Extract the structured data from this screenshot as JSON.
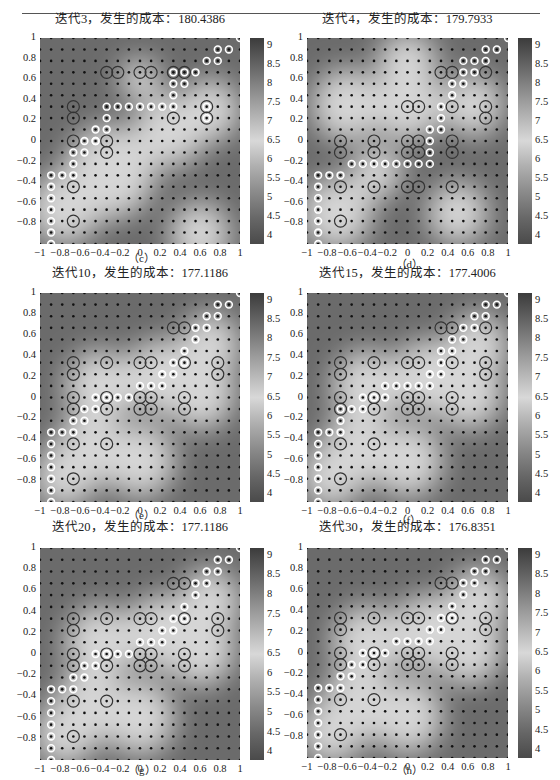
{
  "figure": {
    "panels": [
      {
        "id": "c",
        "title": "迭代3，发生的成本：180.4386",
        "caption": "（c）"
      },
      {
        "id": "d",
        "title": "迭代4，发生的成本：179.7933",
        "caption": "（d）"
      },
      {
        "id": "e",
        "title": "迭代10，发生的成本：177.1186",
        "caption": "（e）"
      },
      {
        "id": "f",
        "title": "迭代15，发生的成本：177.4006",
        "caption": "（f）"
      },
      {
        "id": "g",
        "title": "迭代20，发生的成本：177.1186",
        "caption": "（g）"
      },
      {
        "id": "h",
        "title": "迭代30，发生的成本：176.8351",
        "caption": "（h）"
      }
    ],
    "y_ticks": [
      "1",
      "0.8",
      "0.6",
      "0.4",
      "0.2",
      "0",
      "−0.2",
      "−0.4",
      "−0.6",
      "−0.8"
    ],
    "x_ticks": [
      "−1",
      "−0.8",
      "−0.6",
      "−0.4",
      "−0.2",
      "0",
      "0.2",
      "0.4",
      "0.6",
      "0.8",
      "1"
    ],
    "colorbar_ticks": [
      "9",
      "8.5",
      "8",
      "7.5",
      "7",
      "6.5",
      "6",
      "5.5",
      "5",
      "4.5",
      "4"
    ]
  },
  "chart_data": [
    {
      "type": "heatmap",
      "title": "迭代3，发生的成本：180.4386",
      "iteration": 3,
      "cost": 180.4386,
      "xlim": [
        -1,
        1
      ],
      "ylim": [
        -1,
        1
      ],
      "colorbar_range": [
        3.8,
        9.2
      ],
      "grid_points": "19x19",
      "caption": "(c)"
    },
    {
      "type": "heatmap",
      "title": "迭代4，发生的成本：179.7933",
      "iteration": 4,
      "cost": 179.7933,
      "xlim": [
        -1,
        1
      ],
      "ylim": [
        -1,
        1
      ],
      "colorbar_range": [
        3.8,
        9.2
      ],
      "grid_points": "19x19",
      "caption": "(d)"
    },
    {
      "type": "heatmap",
      "title": "迭代10，发生的成本：177.1186",
      "iteration": 10,
      "cost": 177.1186,
      "xlim": [
        -1,
        1
      ],
      "ylim": [
        -1,
        1
      ],
      "colorbar_range": [
        3.8,
        9.2
      ],
      "grid_points": "19x19",
      "caption": "(e)"
    },
    {
      "type": "heatmap",
      "title": "迭代15，发生的成本：177.4006",
      "iteration": 15,
      "cost": 177.4006,
      "xlim": [
        -1,
        1
      ],
      "ylim": [
        -1,
        1
      ],
      "colorbar_range": [
        3.8,
        9.2
      ],
      "grid_points": "19x19",
      "caption": "(f)"
    },
    {
      "type": "heatmap",
      "title": "迭代20，发生的成本：177.1186",
      "iteration": 20,
      "cost": 177.1186,
      "xlim": [
        -1,
        1
      ],
      "ylim": [
        -1,
        1
      ],
      "colorbar_range": [
        3.8,
        9.2
      ],
      "grid_points": "19x19",
      "caption": "(g)"
    },
    {
      "type": "heatmap",
      "title": "迭代30，发生的成本：176.8351",
      "iteration": 30,
      "cost": 176.8351,
      "xlim": [
        -1,
        1
      ],
      "ylim": [
        -1,
        1
      ],
      "colorbar_range": [
        3.8,
        9.2
      ],
      "grid_points": "19x19",
      "caption": "(h)"
    }
  ]
}
